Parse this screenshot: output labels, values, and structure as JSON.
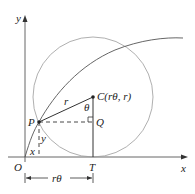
{
  "diagram": {
    "axes": {
      "x_label": "x",
      "y_label": "y",
      "origin_label": "O"
    },
    "points": {
      "P": {
        "label": "P"
      },
      "C": {
        "label": "C(rθ, r)"
      },
      "Q": {
        "label": "Q"
      },
      "T": {
        "label": "T"
      }
    },
    "segment_labels": {
      "radius": "r",
      "angle": "θ",
      "x_offset": "x",
      "y_offset": "y",
      "arc_length": "rθ"
    },
    "colors": {
      "stroke": "#333333",
      "circle": "#999999",
      "curve": "#555555"
    }
  }
}
